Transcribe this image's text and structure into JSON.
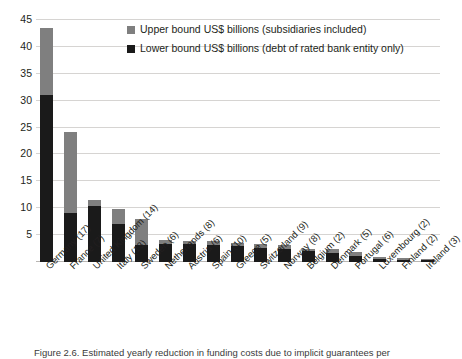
{
  "chart_data": {
    "type": "bar",
    "subtype": "stacked-range",
    "title": "",
    "xlabel": "",
    "ylabel": "",
    "ylim": [
      0,
      45
    ],
    "ytick_step": 5,
    "yticks": [
      5,
      10,
      15,
      20,
      25,
      30,
      35,
      40,
      45
    ],
    "ytick_labels": [
      "5",
      "10",
      "15",
      "20",
      "25",
      "30",
      "35",
      "40",
      "45"
    ],
    "grid": true,
    "legend_position": "top-center",
    "categories": [
      "Germany (17)",
      "France (7)",
      "United Kingdom (14)",
      "Italy (13)",
      "Sweden (6)",
      "Netherlands (8)",
      "Austria (6)",
      "Spain (10)",
      "Greece (5)",
      "Switzerland (9)",
      "Norway (8)",
      "Belgium (2)",
      "Denmark (5)",
      "Portugal (6)",
      "Luxembourg (2)",
      "Finland (2)",
      "Ireland (3)"
    ],
    "series": [
      {
        "name": "Upper bound US$ billions (subsidiaries included)",
        "color": "#7f7f7f",
        "values": [
          43.5,
          24.2,
          11.6,
          9.9,
          8.0,
          4.1,
          4.0,
          3.9,
          3.6,
          3.4,
          3.1,
          2.5,
          2.4,
          1.9,
          1.0,
          0.7,
          0.6
        ]
      },
      {
        "name": "Lower bound US$ billions (debt of rated bank entity only)",
        "color": "#1a1a1a",
        "values": [
          31.0,
          9.1,
          10.5,
          7.1,
          3.1,
          3.4,
          3.3,
          3.2,
          2.9,
          2.6,
          2.4,
          2.1,
          1.6,
          1.1,
          0.5,
          0.4,
          0.3
        ]
      }
    ],
    "legend": [
      "Upper bound US$ billions (subsidiaries included)",
      "Lower bound US$ billions (debt of rated bank entity only)"
    ]
  },
  "caption": {
    "text": "Figure 2.6. Estimated yearly reduction in funding costs due to implicit guarantees per"
  }
}
